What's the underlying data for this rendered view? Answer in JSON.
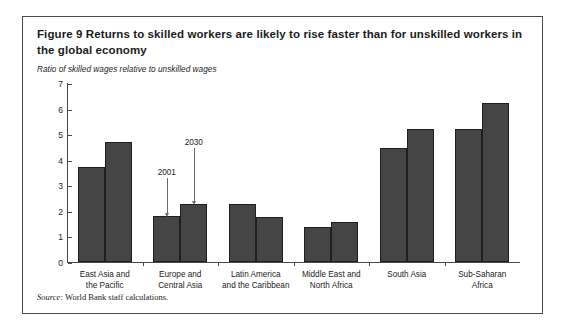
{
  "figure": {
    "number_label": "Figure 9",
    "title": "Returns to skilled workers are likely to rise faster than for unskilled workers in the global economy",
    "source_prefix": "Source:",
    "source_text": "World Bank staff calculations."
  },
  "chart_data": {
    "type": "bar",
    "title": "Figure 9  Returns to skilled workers are likely to rise faster than for unskilled workers in the global economy",
    "ylabel": "Ratio of skilled wages relative to unskilled wages",
    "xlabel": "",
    "ylim": [
      0,
      7
    ],
    "yticks": [
      "0",
      "1",
      "2",
      "3",
      "4",
      "5",
      "6",
      "7"
    ],
    "grid": false,
    "legend": "annotated-arrows",
    "categories": [
      "East Asia and\nthe Pacific",
      "Europe and\nCentral Asia",
      "Latin America\nand the Caribbean",
      "Middle East and\nNorth Africa",
      "South Asia",
      "Sub-Saharan\nAfrica"
    ],
    "category_lines": [
      [
        "East Asia and",
        "the Pacific"
      ],
      [
        "Europe and",
        "Central Asia"
      ],
      [
        "Latin America",
        "and the Caribbean"
      ],
      [
        "Middle East and",
        "North Africa"
      ],
      [
        "South Asia",
        ""
      ],
      [
        "Sub-Saharan",
        "Africa"
      ]
    ],
    "series": [
      {
        "name": "2001",
        "values": [
          3.7,
          1.8,
          2.25,
          1.35,
          4.45,
          5.2
        ]
      },
      {
        "name": "2030",
        "values": [
          4.7,
          2.25,
          1.75,
          1.55,
          5.2,
          6.2
        ]
      }
    ],
    "annotations": [
      {
        "label": "2001",
        "group": 1,
        "series": 0
      },
      {
        "label": "2030",
        "group": 1,
        "series": 1
      }
    ],
    "bar_color": "#454545"
  }
}
